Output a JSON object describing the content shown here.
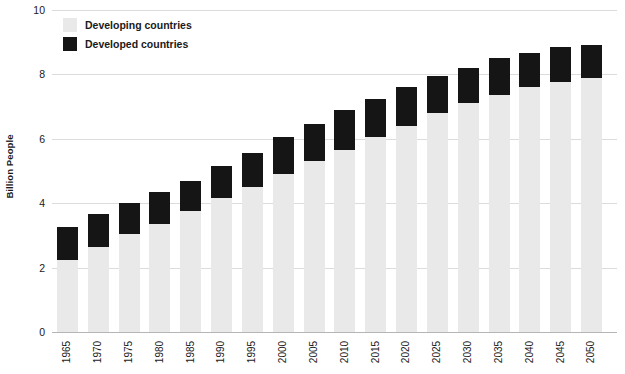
{
  "chart_data": {
    "type": "bar",
    "title": "",
    "subtitle": "",
    "xlabel": "",
    "ylabel": "Billion People",
    "stacked": true,
    "grid": true,
    "legend_position": "top-left",
    "ylim": [
      0,
      10
    ],
    "yticks": [
      0,
      2,
      4,
      6,
      8,
      10
    ],
    "ytick_labels": [
      "0",
      "2",
      "4",
      "6",
      "8",
      "10"
    ],
    "categories": [
      "1965",
      "1970",
      "1975",
      "1980",
      "1985",
      "1990",
      "1995",
      "2000",
      "2005",
      "2010",
      "2015",
      "2020",
      "2025",
      "2030",
      "2035",
      "2040",
      "2045",
      "2050"
    ],
    "series": [
      {
        "name": "Developing countries",
        "color": "#e9e9e9",
        "values": [
          2.25,
          2.65,
          3.05,
          3.35,
          3.75,
          4.15,
          4.5,
          4.9,
          5.3,
          5.65,
          6.05,
          6.4,
          6.8,
          7.1,
          7.35,
          7.6,
          7.75,
          7.9
        ]
      },
      {
        "name": "Developed countries",
        "color": "#151515",
        "values": [
          1.0,
          1.0,
          0.95,
          1.0,
          0.95,
          1.0,
          1.05,
          1.15,
          1.15,
          1.25,
          1.2,
          1.2,
          1.15,
          1.1,
          1.15,
          1.05,
          1.1,
          1.0
        ]
      }
    ],
    "totals": [
      3.25,
      3.65,
      4.0,
      4.35,
      4.7,
      5.15,
      5.55,
      6.05,
      6.45,
      6.9,
      7.25,
      7.6,
      7.95,
      8.2,
      8.5,
      8.65,
      8.85,
      8.9
    ]
  },
  "legend": {
    "items": [
      {
        "label": "Developing countries",
        "swatch_name": "legend-swatch-developing",
        "color": "#e9e9e9"
      },
      {
        "label": "Developed countries",
        "swatch_name": "legend-swatch-developed",
        "color": "#151515"
      }
    ]
  }
}
